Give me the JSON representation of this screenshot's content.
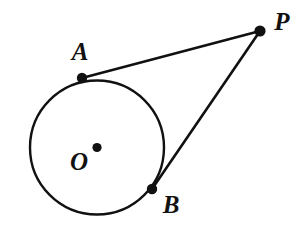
{
  "figure": {
    "background_color": "#ffffff",
    "stroke_color": "#111111",
    "width": 297,
    "height": 231
  },
  "labels": {
    "center": "O",
    "tangent_point_upper": "A",
    "tangent_point_lower": "B",
    "external_point": "P"
  },
  "chart_data": {
    "type": "diagram",
    "circle": {
      "name": "circle-O",
      "center": {
        "label": "O",
        "x": 97,
        "y": 147.5
      },
      "radius": 67
    },
    "points": [
      {
        "label": "A",
        "x": 82,
        "y": 78,
        "role": "tangent-point",
        "label_x": 80,
        "label_y": 60
      },
      {
        "label": "B",
        "x": 152,
        "y": 189,
        "role": "tangent-point",
        "label_x": 171,
        "label_y": 213
      },
      {
        "label": "P",
        "x": 260,
        "y": 31,
        "role": "external-point",
        "label_x": 282,
        "label_y": 30
      },
      {
        "label": "O",
        "x": 97,
        "y": 147.5,
        "role": "center",
        "label_x": 79,
        "label_y": 170
      }
    ],
    "segments": [
      {
        "name": "PA",
        "from": "P",
        "to": "A",
        "x1": 260,
        "y1": 31,
        "x2": 82,
        "y2": 78
      },
      {
        "name": "PB",
        "from": "P",
        "to": "B",
        "x1": 260,
        "y1": 31,
        "x2": 152,
        "y2": 189
      }
    ],
    "grid": false,
    "legend": false
  }
}
